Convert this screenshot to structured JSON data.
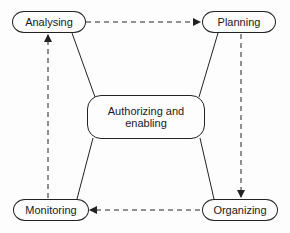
{
  "diagram": {
    "type": "cycle",
    "nodes": {
      "analysing": {
        "label": "Analysing"
      },
      "planning": {
        "label": "Planning"
      },
      "organizing": {
        "label": "Organizing"
      },
      "monitoring": {
        "label": "Monitoring"
      },
      "center": {
        "label_line1": "Authorizing and",
        "label_line2": "enabling"
      }
    },
    "edges": [
      {
        "from": "Analysing",
        "to": "Planning",
        "style": "dashed-arrow"
      },
      {
        "from": "Planning",
        "to": "Organizing",
        "style": "dashed-arrow"
      },
      {
        "from": "Organizing",
        "to": "Monitoring",
        "style": "dashed-arrow"
      },
      {
        "from": "Monitoring",
        "to": "Analysing",
        "style": "dashed-arrow"
      },
      {
        "from": "Authorizing and enabling",
        "to": "Analysing",
        "style": "solid-line"
      },
      {
        "from": "Authorizing and enabling",
        "to": "Planning",
        "style": "solid-line"
      },
      {
        "from": "Authorizing and enabling",
        "to": "Organizing",
        "style": "solid-line"
      },
      {
        "from": "Authorizing and enabling",
        "to": "Monitoring",
        "style": "solid-line"
      }
    ]
  }
}
